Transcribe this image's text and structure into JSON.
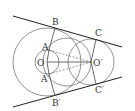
{
  "diagram": {
    "type": "geometry",
    "colors": {
      "stroke": "#555555",
      "tangent": "#222222",
      "label": "#333333",
      "background": "#ffffff"
    },
    "points": {
      "O": {
        "label": "O",
        "x": 47,
        "y": 62
      },
      "O2": {
        "label": "O′",
        "x": 91,
        "y": 62
      },
      "A": {
        "label": "A",
        "x": 49,
        "y": 50
      },
      "A2": {
        "label": "A′",
        "x": 49,
        "y": 74
      },
      "B": {
        "label": "B",
        "x": 55,
        "y": 28
      },
      "B2": {
        "label": "B′",
        "x": 55,
        "y": 96
      },
      "C": {
        "label": "C",
        "x": 96,
        "y": 39
      },
      "C2": {
        "label": "C′",
        "x": 96,
        "y": 84
      }
    },
    "labels": {
      "O": "O",
      "O2": "O′",
      "A": "A",
      "A2": "A′",
      "B": "B",
      "B2": "B′",
      "C": "C",
      "C2": "C′"
    },
    "circles": [
      {
        "name": "big-circle-O",
        "cx": 47,
        "cy": 62,
        "r": 34
      },
      {
        "name": "small-circle-O",
        "cx": 47,
        "cy": 62,
        "r": 12
      },
      {
        "name": "middle-circle",
        "cx": 67,
        "cy": 62,
        "r": 24
      },
      {
        "name": "circle-O2",
        "cx": 91,
        "cy": 62,
        "r": 23
      }
    ],
    "tangent_lines": [
      {
        "name": "upper-tangent",
        "x1": 13,
        "y1": 16,
        "x2": 122,
        "y2": 47
      },
      {
        "name": "lower-tangent",
        "x1": 13,
        "y1": 107,
        "x2": 122,
        "y2": 77
      }
    ]
  }
}
